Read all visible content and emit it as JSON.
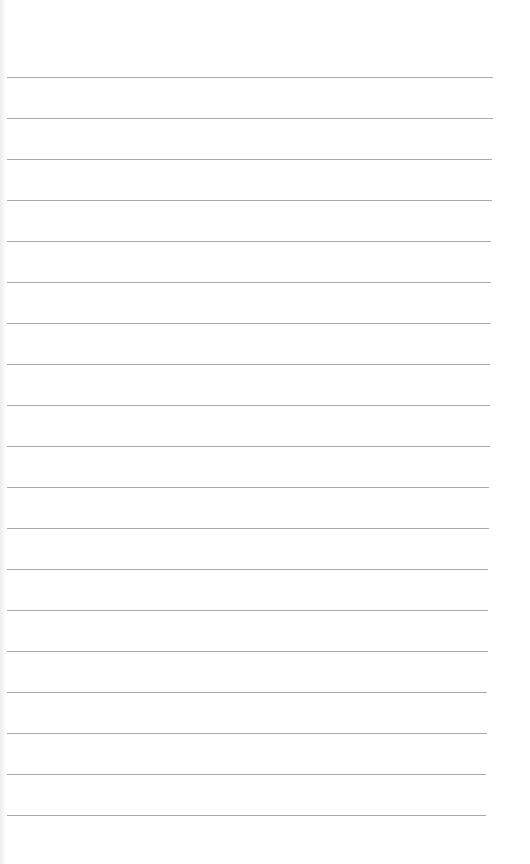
{
  "document": {
    "type": "lined-paper",
    "background_color": "#ffffff",
    "line_color": "#9a9a9a",
    "line_count": 19,
    "first_line_y": 77,
    "line_spacing": 41,
    "line_left": 7,
    "line_right_start": 493,
    "line_right_end": 486,
    "text_content": []
  }
}
